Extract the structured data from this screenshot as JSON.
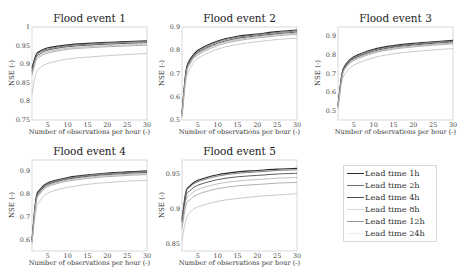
{
  "figure": {
    "legend": {
      "items": [
        {
          "label": "Lead time 1h",
          "color": "#2a2a2a"
        },
        {
          "label": "Lead time 2h",
          "color": "#6e6e6e"
        },
        {
          "label": "Lead time 4h",
          "color": "#4a4a4a"
        },
        {
          "label": "Lead time 8h",
          "color": "#d8d8d8"
        },
        {
          "label": "Lead time 12h",
          "color": "#9a9a9a"
        },
        {
          "label": "Lead time 24h",
          "color": "#eeeeee"
        }
      ]
    }
  },
  "chart_data": [
    {
      "type": "line",
      "title": "Flood event 1",
      "xlabel": "Number of observations per hour (-)",
      "ylabel": "NSE (-)",
      "xlim": [
        1,
        30
      ],
      "ylim": [
        0.75,
        1
      ],
      "xticks": [
        "5",
        "10",
        "15",
        "20",
        "25",
        "30"
      ],
      "yticks": [
        "0.75",
        "0.8",
        "0.85",
        "0.9",
        "0.95",
        "1"
      ],
      "x": [
        1,
        2,
        3,
        5,
        10,
        15,
        20,
        25,
        30
      ],
      "series": [
        {
          "name": "Lead time 1h",
          "values": [
            0.89,
            0.925,
            0.935,
            0.944,
            0.952,
            0.956,
            0.959,
            0.961,
            0.963
          ]
        },
        {
          "name": "Lead time 2h",
          "values": [
            0.885,
            0.922,
            0.932,
            0.941,
            0.95,
            0.954,
            0.957,
            0.959,
            0.961
          ]
        },
        {
          "name": "Lead time 4h",
          "values": [
            0.88,
            0.918,
            0.928,
            0.938,
            0.947,
            0.951,
            0.954,
            0.956,
            0.958
          ]
        },
        {
          "name": "Lead time 8h",
          "values": [
            0.875,
            0.914,
            0.924,
            0.934,
            0.943,
            0.947,
            0.95,
            0.952,
            0.954
          ]
        },
        {
          "name": "Lead time 12h",
          "values": [
            0.87,
            0.91,
            0.92,
            0.93,
            0.94,
            0.944,
            0.947,
            0.949,
            0.951
          ]
        },
        {
          "name": "Lead time 24h",
          "values": [
            0.82,
            0.875,
            0.89,
            0.902,
            0.914,
            0.919,
            0.923,
            0.926,
            0.929
          ]
        }
      ],
      "grid": false,
      "legend_position": "external-bottom-right"
    },
    {
      "type": "line",
      "title": "Flood event 2",
      "xlabel": "Number of observations per hour (-)",
      "ylabel": "NSE (-)",
      "xlim": [
        1,
        30
      ],
      "ylim": [
        0.5,
        0.9
      ],
      "xticks": [
        "5",
        "10",
        "15",
        "20",
        "25",
        "30"
      ],
      "yticks": [
        "0.5",
        "0.6",
        "0.7",
        "0.8",
        "0.9"
      ],
      "x": [
        1,
        2,
        3,
        5,
        10,
        15,
        20,
        25,
        30
      ],
      "series": [
        {
          "name": "Lead time 1h",
          "values": [
            0.53,
            0.71,
            0.76,
            0.8,
            0.84,
            0.86,
            0.87,
            0.88,
            0.887
          ]
        },
        {
          "name": "Lead time 2h",
          "values": [
            0.53,
            0.705,
            0.755,
            0.795,
            0.836,
            0.856,
            0.867,
            0.876,
            0.883
          ]
        },
        {
          "name": "Lead time 4h",
          "values": [
            0.52,
            0.7,
            0.75,
            0.79,
            0.83,
            0.851,
            0.862,
            0.871,
            0.878
          ]
        },
        {
          "name": "Lead time 8h",
          "values": [
            0.52,
            0.695,
            0.745,
            0.785,
            0.826,
            0.846,
            0.858,
            0.867,
            0.874
          ]
        },
        {
          "name": "Lead time 12h",
          "values": [
            0.52,
            0.69,
            0.74,
            0.78,
            0.82,
            0.841,
            0.853,
            0.862,
            0.869
          ]
        },
        {
          "name": "Lead time 24h",
          "values": [
            0.51,
            0.67,
            0.72,
            0.765,
            0.805,
            0.825,
            0.837,
            0.846,
            0.852
          ]
        }
      ],
      "grid": false
    },
    {
      "type": "line",
      "title": "Flood event 3",
      "xlabel": "Number of observations per hour (-)",
      "ylabel": "NSE (-)",
      "xlim": [
        1,
        30
      ],
      "ylim": [
        0.45,
        0.95
      ],
      "xticks": [
        "5",
        "10",
        "15",
        "20",
        "25",
        "30"
      ],
      "yticks": [
        "0.5",
        "0.6",
        "0.7",
        "0.8",
        "0.9"
      ],
      "x": [
        1,
        2,
        3,
        5,
        10,
        15,
        20,
        25,
        30
      ],
      "series": [
        {
          "name": "Lead time 1h",
          "values": [
            0.53,
            0.7,
            0.75,
            0.79,
            0.83,
            0.85,
            0.862,
            0.871,
            0.878
          ]
        },
        {
          "name": "Lead time 2h",
          "values": [
            0.53,
            0.695,
            0.745,
            0.785,
            0.826,
            0.846,
            0.858,
            0.867,
            0.874
          ]
        },
        {
          "name": "Lead time 4h",
          "values": [
            0.52,
            0.69,
            0.74,
            0.78,
            0.82,
            0.841,
            0.853,
            0.862,
            0.869
          ]
        },
        {
          "name": "Lead time 8h",
          "values": [
            0.52,
            0.685,
            0.735,
            0.775,
            0.815,
            0.836,
            0.848,
            0.857,
            0.864
          ]
        },
        {
          "name": "Lead time 12h",
          "values": [
            0.52,
            0.68,
            0.73,
            0.77,
            0.81,
            0.831,
            0.843,
            0.852,
            0.859
          ]
        },
        {
          "name": "Lead time 24h",
          "values": [
            0.51,
            0.655,
            0.705,
            0.745,
            0.785,
            0.806,
            0.818,
            0.827,
            0.834
          ]
        }
      ],
      "grid": false
    },
    {
      "type": "line",
      "title": "Flood event 4",
      "xlabel": "Number of observations per hour (-)",
      "ylabel": "NSE (-)",
      "xlim": [
        1,
        30
      ],
      "ylim": [
        0.55,
        0.95
      ],
      "xticks": [
        "5",
        "10",
        "15",
        "20",
        "25",
        "30"
      ],
      "yticks": [
        "0.6",
        "0.7",
        "0.8",
        "0.9"
      ],
      "x": [
        1,
        2,
        3,
        5,
        10,
        15,
        20,
        25,
        30
      ],
      "series": [
        {
          "name": "Lead time 1h",
          "values": [
            0.6,
            0.78,
            0.82,
            0.85,
            0.873,
            0.885,
            0.893,
            0.898,
            0.902
          ]
        },
        {
          "name": "Lead time 2h",
          "values": [
            0.6,
            0.775,
            0.815,
            0.846,
            0.87,
            0.882,
            0.89,
            0.895,
            0.899
          ]
        },
        {
          "name": "Lead time 4h",
          "values": [
            0.59,
            0.77,
            0.81,
            0.842,
            0.866,
            0.878,
            0.886,
            0.891,
            0.895
          ]
        },
        {
          "name": "Lead time 8h",
          "values": [
            0.59,
            0.765,
            0.805,
            0.838,
            0.862,
            0.874,
            0.882,
            0.887,
            0.891
          ]
        },
        {
          "name": "Lead time 12h",
          "values": [
            0.59,
            0.76,
            0.8,
            0.833,
            0.857,
            0.869,
            0.877,
            0.882,
            0.886
          ]
        },
        {
          "name": "Lead time 24h",
          "values": [
            0.58,
            0.73,
            0.77,
            0.805,
            0.83,
            0.843,
            0.851,
            0.857,
            0.861
          ]
        }
      ],
      "grid": false
    },
    {
      "type": "line",
      "title": "Flood event 5",
      "xlabel": "Number of observations per hour (-)",
      "ylabel": "NSE (-)",
      "xlim": [
        1,
        30
      ],
      "ylim": [
        0.84,
        0.97
      ],
      "xticks": [
        "5",
        "10",
        "15",
        "20",
        "25",
        "30"
      ],
      "yticks": [
        "0.85",
        "0.9",
        "0.95"
      ],
      "x": [
        1,
        2,
        3,
        5,
        10,
        15,
        20,
        25,
        30
      ],
      "series": [
        {
          "name": "Lead time 1h",
          "values": [
            0.885,
            0.925,
            0.933,
            0.941,
            0.949,
            0.953,
            0.955,
            0.957,
            0.958
          ]
        },
        {
          "name": "Lead time 2h",
          "values": [
            0.883,
            0.923,
            0.931,
            0.939,
            0.947,
            0.951,
            0.953,
            0.955,
            0.956
          ]
        },
        {
          "name": "Lead time 4h",
          "values": [
            0.88,
            0.918,
            0.926,
            0.934,
            0.942,
            0.946,
            0.948,
            0.95,
            0.951
          ]
        },
        {
          "name": "Lead time 8h",
          "values": [
            0.876,
            0.912,
            0.92,
            0.928,
            0.936,
            0.94,
            0.942,
            0.944,
            0.945
          ]
        },
        {
          "name": "Lead time 12h",
          "values": [
            0.872,
            0.905,
            0.913,
            0.921,
            0.929,
            0.933,
            0.935,
            0.937,
            0.938
          ]
        },
        {
          "name": "Lead time 24h",
          "values": [
            0.855,
            0.885,
            0.895,
            0.903,
            0.911,
            0.915,
            0.918,
            0.92,
            0.922
          ]
        }
      ],
      "grid": false
    }
  ]
}
